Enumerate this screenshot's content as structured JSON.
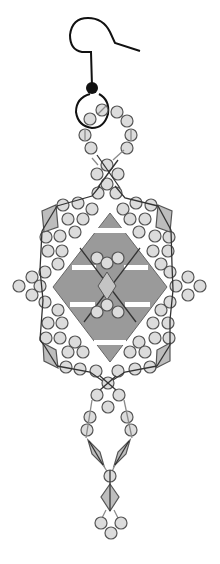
{
  "diagram": {
    "colors": {
      "background": "#ffffff",
      "bead_fill": "#dcdcdc",
      "bead_stroke": "#555555",
      "bicone_fill": "#bdbdbd",
      "cabochon_fill": "#9a9a9a",
      "center_diamond_fill": "#c4c4c4",
      "thread_dark": "#333333",
      "thread_light": "#8a8a8a",
      "earwire": "#111111"
    },
    "components": {
      "earwire": {
        "label": "ear wire hook",
        "cx": 92,
        "cy": 88
      },
      "jump_ring": {
        "label": "jump ring loop",
        "cx": 95,
        "cy": 113,
        "r": 17
      },
      "top_loop_beads": 10,
      "cabochon": {
        "label": "central diamond cabochon",
        "top": [
          110,
          213
        ],
        "right": [
          167,
          287
        ],
        "bottom": [
          110,
          362
        ],
        "left": [
          53,
          287
        ]
      },
      "center_bicone": {
        "label": "center bicone crystal"
      },
      "corner_bicones": 4,
      "side_clusters": 2,
      "dangle_bicones": 3,
      "bottom_loop_beads": 3
    }
  }
}
